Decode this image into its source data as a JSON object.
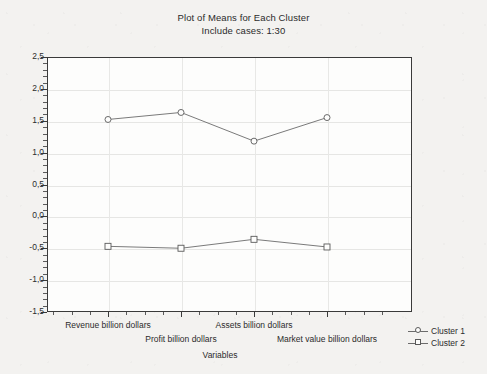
{
  "chart_data": {
    "type": "line",
    "title": "Plot of Means for Each Cluster",
    "subtitle": "Include cases: 1:30",
    "xlabel": "Variables",
    "ylabel": "",
    "categories": [
      "Revenue billion dollars",
      "Profit billion dollars",
      "Assets billion dollars",
      "Market value billion dollars"
    ],
    "series": [
      {
        "name": "Cluster  1",
        "marker": "circle",
        "values": [
          1.52,
          1.63,
          1.18,
          1.55
        ]
      },
      {
        "name": "Cluster  2",
        "marker": "square",
        "values": [
          -0.47,
          -0.5,
          -0.36,
          -0.48
        ]
      }
    ],
    "ylim": [
      -1.5,
      2.5
    ],
    "yticks": [
      "2,5",
      "2,0",
      "1,5",
      "1,0",
      "0,5",
      "0,0",
      "-0,5",
      "-1,0",
      "-1,5"
    ],
    "ytick_values": [
      2.5,
      2.0,
      1.5,
      1.0,
      0.5,
      0.0,
      -0.5,
      -1.0,
      -1.5
    ],
    "grid": true,
    "legend_position": "bottom-right",
    "line_color": "#6b6b6b",
    "marker_edge_color": "#5a5a5a",
    "axis_color": "#3a3a3a",
    "grid_color": "#e6e6e4",
    "plot_background": "#fdfdfc",
    "figure_background": "#f3f2f0"
  },
  "legend": {
    "items": [
      {
        "label": "Cluster  1",
        "marker": "circle"
      },
      {
        "label": "Cluster  2",
        "marker": "square"
      }
    ]
  }
}
